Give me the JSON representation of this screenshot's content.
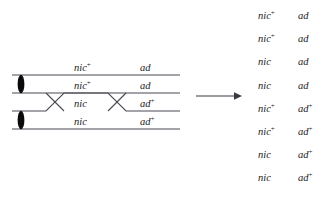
{
  "figure": {
    "type": "genetics-crossover-diagram",
    "top_cut_text": {
      "fragment_1": "",
      "fragment_2": "",
      "fragment_3": ""
    }
  },
  "tetrad": {
    "strand_count": 4,
    "centromere_count": 2,
    "crossover_count": 2,
    "line_color": "#4a4a52",
    "centromere_color": "#0a0a0a",
    "strands": [
      {
        "nic": "nic",
        "nic_sup": "+",
        "ad": "ad",
        "ad_sup": ""
      },
      {
        "nic": "nic",
        "nic_sup": "+",
        "ad": "ad",
        "ad_sup": ""
      },
      {
        "nic": "nic",
        "nic_sup": "",
        "ad": "ad",
        "ad_sup": "+"
      },
      {
        "nic": "nic",
        "nic_sup": "",
        "ad": "ad",
        "ad_sup": "+"
      }
    ]
  },
  "arrow": {
    "direction": "right",
    "color": "#3a3a42"
  },
  "octad": {
    "row_count": 8,
    "rows": [
      {
        "nic": "nic",
        "nic_sup": "+",
        "ad": "ad",
        "ad_sup": ""
      },
      {
        "nic": "nic",
        "nic_sup": "+",
        "ad": "ad",
        "ad_sup": ""
      },
      {
        "nic": "nic",
        "nic_sup": "",
        "ad": "ad",
        "ad_sup": ""
      },
      {
        "nic": "nic",
        "nic_sup": "",
        "ad": "ad",
        "ad_sup": ""
      },
      {
        "nic": "nic",
        "nic_sup": "+",
        "ad": "ad",
        "ad_sup": "+"
      },
      {
        "nic": "nic",
        "nic_sup": "+",
        "ad": "ad",
        "ad_sup": "+"
      },
      {
        "nic": "nic",
        "nic_sup": "",
        "ad": "ad",
        "ad_sup": "+"
      },
      {
        "nic": "nic",
        "nic_sup": "",
        "ad": "ad",
        "ad_sup": "+"
      }
    ]
  }
}
